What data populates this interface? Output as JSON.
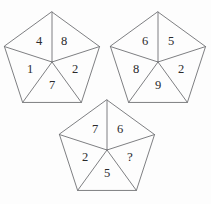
{
  "figure": {
    "background_color": "#fdfdfd",
    "stroke_color": "#6f7074",
    "text_color": "#2a2a2c"
  },
  "pentagons": [
    {
      "id": "pentagon-left",
      "name": "left-pentagon",
      "center_x": 52,
      "center_y": 62,
      "radius": 50,
      "cells": [
        {
          "position": "top-left",
          "value": "4",
          "label_x": 39,
          "label_y": 42
        },
        {
          "position": "top-right",
          "value": "8",
          "label_x": 64,
          "label_y": 42
        },
        {
          "position": "right",
          "value": "2",
          "label_x": 75,
          "label_y": 70
        },
        {
          "position": "bottom",
          "value": "7",
          "label_x": 52,
          "label_y": 86
        },
        {
          "position": "left",
          "value": "1",
          "label_x": 30,
          "label_y": 70
        }
      ]
    },
    {
      "id": "pentagon-right",
      "name": "right-pentagon",
      "center_x": 158,
      "center_y": 62,
      "radius": 50,
      "cells": [
        {
          "position": "top-left",
          "value": "6",
          "label_x": 145,
          "label_y": 42
        },
        {
          "position": "top-right",
          "value": "5",
          "label_x": 171,
          "label_y": 42
        },
        {
          "position": "right",
          "value": "2",
          "label_x": 181,
          "label_y": 70
        },
        {
          "position": "bottom",
          "value": "9",
          "label_x": 158,
          "label_y": 86
        },
        {
          "position": "left",
          "value": "8",
          "label_x": 136,
          "label_y": 70
        }
      ]
    },
    {
      "id": "pentagon-bottom",
      "name": "bottom-pentagon",
      "center_x": 107,
      "center_y": 150,
      "radius": 50,
      "cells": [
        {
          "position": "top-left",
          "value": "7",
          "label_x": 95,
          "label_y": 130
        },
        {
          "position": "top-right",
          "value": "6",
          "label_x": 120,
          "label_y": 130
        },
        {
          "position": "right",
          "value": "?",
          "label_x": 130,
          "label_y": 158
        },
        {
          "position": "bottom",
          "value": "5",
          "label_x": 107,
          "label_y": 174
        },
        {
          "position": "left",
          "value": "2",
          "label_x": 85,
          "label_y": 158
        }
      ]
    }
  ]
}
